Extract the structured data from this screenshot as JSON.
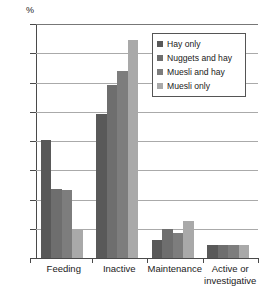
{
  "chart_data": {
    "type": "bar",
    "title": "",
    "xlabel": "",
    "ylabel": "%",
    "ylim": [
      0,
      80
    ],
    "yticks": [
      0,
      10,
      20,
      30,
      40,
      50,
      60,
      70,
      80
    ],
    "ytick_labels": [
      "0",
      "10",
      "20",
      "30",
      "40",
      "50",
      "60",
      "70",
      "80"
    ],
    "grid": true,
    "grid_axis": "y",
    "legend_position": "upper right inside",
    "categories": [
      "Feeding",
      "Inactive",
      "Maintenance",
      "Active or investigative"
    ],
    "category_label_lines": [
      [
        "Feeding"
      ],
      [
        "Inactive"
      ],
      [
        "Maintenance"
      ],
      [
        "Active or",
        "investigative"
      ]
    ],
    "series": [
      {
        "name": "Hay only",
        "color": "#595959",
        "values": [
          40.5,
          49.2,
          6.0,
          4.3
        ]
      },
      {
        "name": "Nuggets and hay",
        "color": "#6e6e6e",
        "values": [
          23.5,
          59.2,
          10.0,
          4.3
        ]
      },
      {
        "name": "Muesli and hay",
        "color": "#7d7d7d",
        "values": [
          23.4,
          64.0,
          8.4,
          4.3
        ]
      },
      {
        "name": "Muesli only",
        "color": "#a9a9a9",
        "values": [
          9.5,
          74.6,
          12.6,
          4.3
        ]
      }
    ]
  },
  "colors": {
    "background": "#ffffff",
    "axis": "#4a4a4a",
    "gridline": "#aaaaaa",
    "text": "#1a1a1a",
    "legend_border": "#555555"
  }
}
